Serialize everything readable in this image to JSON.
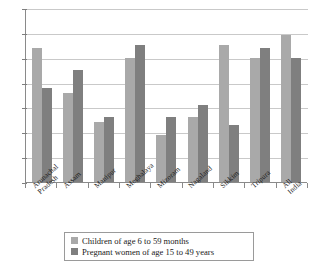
{
  "chart_data": {
    "type": "bar",
    "title": "",
    "subtitle": "",
    "xlabel": "",
    "ylabel": "",
    "ylim": [
      0,
      70
    ],
    "ytick_values": [
      0,
      10,
      20,
      30,
      40,
      50,
      60,
      70
    ],
    "ytick_labels": [
      "",
      "",
      "",
      "",
      "",
      "",
      "",
      ""
    ],
    "grid": true,
    "legend_position": "bottom",
    "categories": [
      "Arunachal\nPradesh",
      "Assam",
      "Manipur",
      "Meghalaya",
      "Mizoram",
      "Nagaland",
      "Sikkim",
      "Tripura",
      "All India"
    ],
    "series": [
      {
        "name": "Children of age 6 to 59 months",
        "color": "#a9a9a9",
        "values": [
          54,
          36,
          24,
          50,
          19,
          26,
          55,
          50,
          59
        ]
      },
      {
        "name": "Pregnant women of age 15 to 49 years",
        "color": "#7f7f7f",
        "values": [
          38,
          45,
          26,
          55,
          26,
          31,
          23,
          54,
          50
        ]
      }
    ]
  },
  "legend": {
    "items": [
      {
        "label": "Children of age 6 to 59 months",
        "swatch": "light-grey-swatch"
      },
      {
        "label": "Pregnant women of age 15 to 49 years",
        "swatch": "dark-grey-swatch"
      }
    ]
  }
}
